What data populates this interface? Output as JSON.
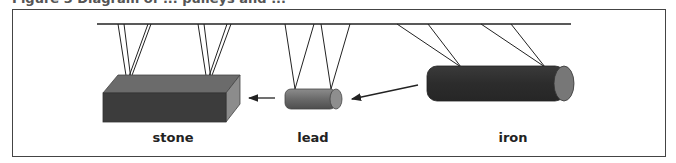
{
  "figure": {
    "caption_partial": "Figure 3 Diagram of ... pulleys and ...",
    "objects": [
      {
        "id": "stone",
        "label": "stone",
        "shape": "rectangular block",
        "color_front": "#3b3b3b",
        "color_top": "#6a6a6a",
        "color_side": "#8a8a8a"
      },
      {
        "id": "lead",
        "label": "lead",
        "shape": "cylinder",
        "color_body": "#666666",
        "color_end": "#8a8a8a"
      },
      {
        "id": "iron",
        "label": "iron",
        "shape": "cylinder",
        "color_body": "#2f2f2f",
        "color_end": "#777777"
      }
    ],
    "arrows": [
      {
        "from": "iron",
        "to": "lead"
      },
      {
        "from": "lead",
        "to": "stone"
      }
    ],
    "beam": {
      "description": "horizontal support bar with suspension ropes"
    }
  }
}
